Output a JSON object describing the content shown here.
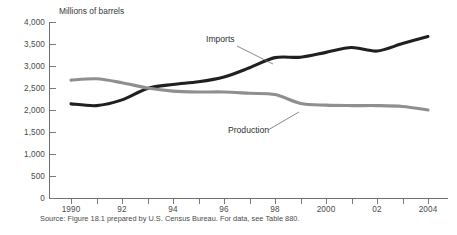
{
  "chart_data": {
    "type": "line",
    "title": "",
    "subtitle": "",
    "ylabel": "Millions of barrels",
    "xlabel": "",
    "x": [
      1990,
      1991,
      1992,
      1993,
      1994,
      1995,
      1996,
      1997,
      1998,
      1999,
      2000,
      2001,
      2002,
      2003,
      2004
    ],
    "xlim": [
      1990,
      2004
    ],
    "ylim": [
      0,
      4000
    ],
    "grid": false,
    "legend_position": "inline-annotation",
    "ytick_labels": [
      "0",
      "500",
      "1,000",
      "1,500",
      "2,000",
      "2,500",
      "3,000",
      "3,500",
      "4,000"
    ],
    "ytick_values": [
      0,
      500,
      1000,
      1500,
      2000,
      2500,
      3000,
      3500,
      4000
    ],
    "xtick_values": [
      1990,
      1991,
      1992,
      1993,
      1994,
      1995,
      1996,
      1997,
      1998,
      1999,
      2000,
      2001,
      2002,
      2003,
      2004
    ],
    "xtick_labels": [
      "1990",
      "",
      "92",
      "",
      "94",
      "",
      "96",
      "",
      "98",
      "",
      "2000",
      "",
      "02",
      "",
      "2004"
    ],
    "series": [
      {
        "name": "Imports",
        "color": "#231f20",
        "values": [
          2140,
          2100,
          2230,
          2490,
          2580,
          2640,
          2750,
          2960,
          3190,
          3200,
          3310,
          3420,
          3340,
          3510,
          3670
        ]
      },
      {
        "name": "Production",
        "color": "#8f8f8f",
        "values": [
          2680,
          2710,
          2620,
          2500,
          2430,
          2410,
          2410,
          2380,
          2350,
          2150,
          2110,
          2100,
          2100,
          2080,
          2000
        ]
      }
    ],
    "annotations": [
      {
        "text": "Imports",
        "target_year": 1998,
        "target_value": 3190
      },
      {
        "text": "Production",
        "target_year": 2001.6,
        "target_value": 2100
      }
    ]
  },
  "source_note": "Source: Figure 18.1 prepared by U.S. Census Bureau.  For data, see Table 880."
}
